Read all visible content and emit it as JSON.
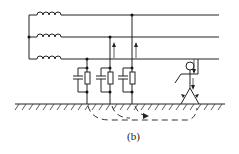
{
  "caption": "(b)",
  "diagram": {
    "phases": [
      {
        "name": "phase-1-wire",
        "y": 15
      },
      {
        "name": "phase-2-wire",
        "y": 37
      },
      {
        "name": "phase-3-wire",
        "y": 59
      }
    ],
    "rc_units": [
      {
        "x": 87,
        "connects_to": "phase-3-wire"
      },
      {
        "x": 110,
        "connects_to": "phase-2-wire"
      },
      {
        "x": 132,
        "connects_to": "phase-1-wire"
      }
    ],
    "ground_y": 104,
    "person_x": 190,
    "elements": [
      "three-phase-coils",
      "leakage-capacitance-resistance",
      "ground",
      "person",
      "current-arrows",
      "return-current-path"
    ]
  }
}
